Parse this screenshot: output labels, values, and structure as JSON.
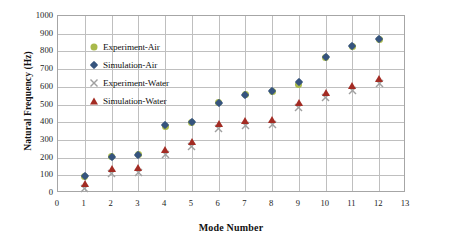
{
  "chart_data": {
    "type": "scatter",
    "title": "",
    "xlabel": "Mode Number",
    "ylabel": "Natural Frequency (Hz)",
    "xlim": [
      0,
      13
    ],
    "ylim": [
      0,
      1000
    ],
    "xticks": [
      "0",
      "1",
      "2",
      "3",
      "4",
      "5",
      "6",
      "7",
      "8",
      "9",
      "10",
      "11",
      "12",
      "13"
    ],
    "yticks": [
      "0",
      "100",
      "200",
      "300",
      "400",
      "500",
      "600",
      "700",
      "800",
      "900",
      "1000"
    ],
    "grid": true,
    "legend_position": "inside-upper-left",
    "x": [
      1,
      2,
      3,
      4,
      5,
      6,
      7,
      8,
      9,
      10,
      11,
      12
    ],
    "series": [
      {
        "name": "Experiment-Air",
        "marker": "circle",
        "color": "#a9b94b",
        "values": [
          95,
          205,
          215,
          375,
          400,
          510,
          555,
          575,
          615,
          765,
          830,
          870
        ]
      },
      {
        "name": "Simulation-Air",
        "marker": "diamond",
        "color": "#36547e",
        "values": [
          95,
          205,
          215,
          385,
          400,
          510,
          555,
          575,
          625,
          770,
          830,
          870
        ]
      },
      {
        "name": "Experiment-Water",
        "marker": "x",
        "color": "#a0a0a0",
        "values": [
          55,
          140,
          145,
          245,
          290,
          390,
          410,
          415,
          510,
          570,
          605,
          645
        ]
      },
      {
        "name": "Simulation-Water",
        "marker": "triangle",
        "color": "#a32b23",
        "values": [
          55,
          140,
          145,
          245,
          290,
          390,
          410,
          415,
          510,
          570,
          605,
          645
        ]
      }
    ]
  },
  "axes": {
    "x_title": "Mode Number",
    "y_title": "Natural Frequency (Hz)"
  }
}
